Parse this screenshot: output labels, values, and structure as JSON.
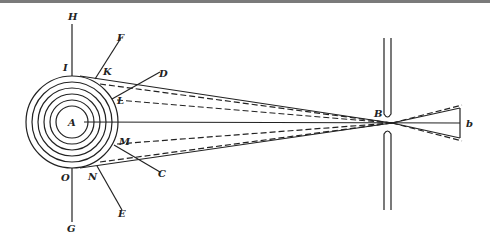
{
  "figure": {
    "type": "optics-diagram",
    "colors": {
      "ink": "#222222",
      "background": "#ffffff",
      "top_rule": "#7a7a7a"
    }
  },
  "labels": {
    "H": "H",
    "I": "I",
    "F": "F",
    "K": "K",
    "D": "D",
    "L": "L",
    "A": "A",
    "M": "M",
    "C": "C",
    "N": "N",
    "O": "O",
    "E": "E",
    "G": "G",
    "B": "B",
    "b": "b"
  },
  "geometry": {
    "source_center": [
      72,
      122
    ],
    "ring_radii": [
      16,
      22,
      28,
      34,
      40,
      46
    ],
    "slit_x": [
      384,
      391
    ],
    "slit_gap_y": [
      118,
      130
    ],
    "focus_point": [
      392,
      123
    ],
    "image_end_x": 460
  }
}
